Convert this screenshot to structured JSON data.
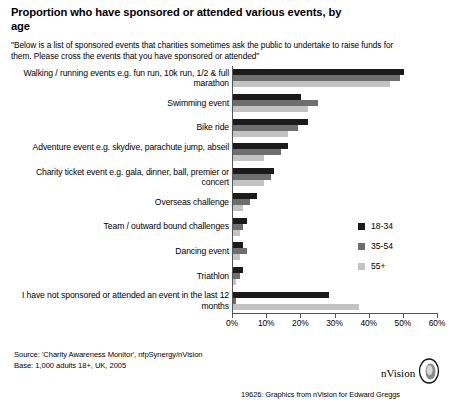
{
  "chart_data": {
    "type": "bar",
    "orientation": "horizontal",
    "title": "Proportion who have sponsored or attended various events, by age",
    "subtitle": "\"Below is a list of sponsored events that charities sometimes ask the public to undertake to raise funds for them.  Please cross the events that you have sponsored or attended\"",
    "xlabel": "",
    "ylabel": "",
    "xlim": [
      0,
      60
    ],
    "grid": false,
    "legend_position": "middle-right",
    "tick_labels": [
      "0%",
      "10%",
      "20%",
      "30%",
      "40%",
      "50%",
      "60%"
    ],
    "tick_values": [
      0,
      10,
      20,
      30,
      40,
      50,
      60
    ],
    "categories": [
      "Walking / running events e.g. fun run, 10k run, 1/2 & full marathon",
      "Swimming event",
      "Bike ride",
      "Adventure event e.g. skydive, parachute jump, abseil",
      "Charity ticket event e.g. gala, dinner, ball, premier or concert",
      "Overseas challenge",
      "Team / outward bound challenges",
      "Dancing event",
      "Triathlon",
      "I have not sponsored or attended an event in the last 12 months"
    ],
    "series": [
      {
        "name": "18-34",
        "color": "#1b1b1b",
        "values": [
          50,
          20,
          22,
          16,
          12,
          7,
          4,
          3,
          3,
          28
        ]
      },
      {
        "name": "35-54",
        "color": "#6e6e6e",
        "values": [
          49,
          25,
          19,
          14,
          11,
          5,
          3,
          4,
          2,
          1
        ]
      },
      {
        "name": "55+",
        "color": "#c3c3c3",
        "values": [
          46,
          22,
          16,
          9,
          9,
          3,
          2,
          2,
          1,
          37
        ]
      }
    ]
  },
  "legend": {
    "items": [
      {
        "label": "18-34",
        "color": "#1b1b1b"
      },
      {
        "label": "35-54",
        "color": "#6e6e6e"
      },
      {
        "label": "55+",
        "color": "#c3c3c3"
      }
    ]
  },
  "footer": {
    "source": "Source: 'Charity Awareness Monitor', nfpSynergy/nVision",
    "base": "Base: 1,000 adults 18+, UK, 2005",
    "credit": "19626: Graphics from  nVision  for Edward Greggs",
    "logo_text": "nVision"
  }
}
